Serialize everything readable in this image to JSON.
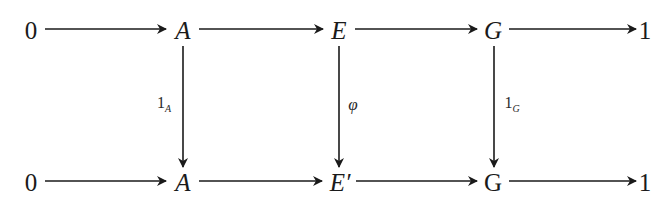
{
  "diagram": {
    "type": "commutative-diagram",
    "top_row": {
      "nodes": [
        "0",
        "A",
        "E",
        "G",
        "1"
      ]
    },
    "bottom_row": {
      "nodes": [
        "0",
        "A",
        "E′",
        "G",
        "1"
      ]
    },
    "vertical_maps": [
      {
        "from": "A",
        "to": "A",
        "label_main": "1",
        "label_sub": "A",
        "side": "left"
      },
      {
        "from": "E",
        "to": "E′",
        "label_main": "φ",
        "label_sub": "",
        "side": "right"
      },
      {
        "from": "G",
        "to": "G",
        "label_main": "1",
        "label_sub": "G",
        "side": "right"
      }
    ],
    "colors": {
      "ink": "#1a1a1a",
      "background": "#ffffff"
    }
  }
}
